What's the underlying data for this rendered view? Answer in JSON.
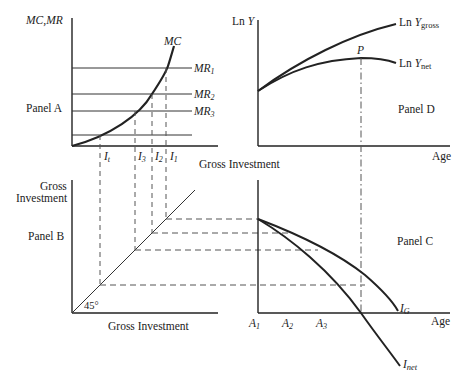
{
  "diagram": {
    "panels": {
      "A": {
        "label": "Panel A",
        "y_axis_label": "MC,MR",
        "x_axis_label": "Gross Investment",
        "curve_label": "MC",
        "mr_labels": [
          "MR",
          "MR",
          "MR"
        ],
        "mr_subscripts": [
          "1",
          "2",
          "3"
        ],
        "investment_labels": [
          "I",
          "I",
          "I",
          "I"
        ],
        "investment_subscripts": [
          "t",
          "3",
          "2",
          "1"
        ]
      },
      "B": {
        "label": "Panel B",
        "y_axis_label_line1": "Gross",
        "y_axis_label_line2": "Investment",
        "x_axis_label": "Gross Investment",
        "angle_label": "45°"
      },
      "C": {
        "label": "Panel C",
        "x_axis_label": "Age",
        "age_labels": [
          "A",
          "A",
          "A"
        ],
        "age_subscripts": [
          "1",
          "2",
          "3"
        ],
        "curve_labels": {
          "gross": "I",
          "gross_sub": "G",
          "net": "I",
          "net_sub": "net"
        }
      },
      "D": {
        "label": "Panel D",
        "y_axis_label": "Ln Y",
        "y_axis_ln": "Ln",
        "y_axis_var": "Y",
        "x_axis_label": "Age",
        "peak_label": "P",
        "curve_labels": {
          "gross_prefix": "Ln",
          "gross_var": "Y",
          "gross_sub": "gross",
          "net_prefix": "Ln",
          "net_var": "Y",
          "net_sub": "net"
        }
      }
    },
    "colors": {
      "line": "#222222",
      "dash": "#555555"
    }
  }
}
